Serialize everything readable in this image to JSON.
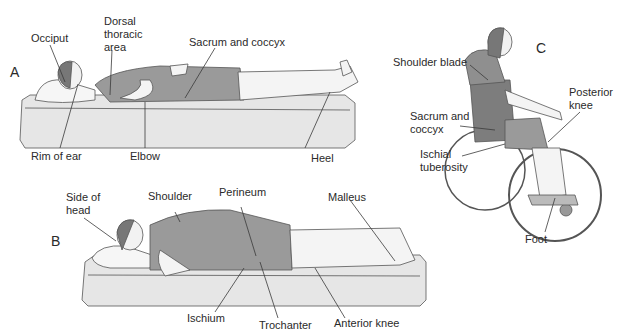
{
  "panels": {
    "a": {
      "letter": "A",
      "labels": {
        "occiput": "Occiput",
        "dorsal": "Dorsal\nthoracic\narea",
        "sacrum": "Sacrum and coccyx",
        "rim_ear": "Rim of ear",
        "elbow": "Elbow",
        "heel": "Heel"
      }
    },
    "b": {
      "letter": "B",
      "labels": {
        "side_head": "Side of\nhead",
        "shoulder": "Shoulder",
        "perineum": "Perineum",
        "malleus": "Malleus",
        "ischium": "Ischium",
        "trochanter": "Trochanter",
        "anterior_knee": "Anterior knee"
      }
    },
    "c": {
      "letter": "C",
      "labels": {
        "shoulder_blade": "Shoulder blade",
        "sacrum": "Sacrum and\ncoccyx",
        "ischial": "Ischial\ntuberosity",
        "posterior_knee": "Posterior\nknee",
        "foot": "Foot"
      }
    }
  },
  "colors": {
    "mattress": "#e6e6e6",
    "gown": "#9a9a9a",
    "skin": "#f4f4f4",
    "hair": "#7a7a7a",
    "line": "#3a3a3a",
    "seat": "#7d7d7d"
  }
}
